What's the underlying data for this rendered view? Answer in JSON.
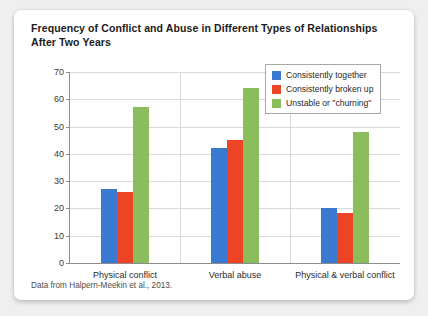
{
  "card": {
    "title": "Frequency of Conflict and Abuse in Different Types of Relationships After Two Years",
    "source_note": "Data from Halpern-Meekin et al., 2013."
  },
  "chart_data": {
    "type": "bar",
    "title": "Frequency of Conflict and Abuse in Different Types of Relationships After Two Years",
    "xlabel": "",
    "ylabel": "",
    "ylim": [
      0,
      70
    ],
    "yticks": [
      0,
      10,
      20,
      30,
      40,
      50,
      60,
      70
    ],
    "grid": true,
    "legend_position": "top-right",
    "categories": [
      "Physical conflict",
      "Verbal abuse",
      "Physical & verbal conflict"
    ],
    "series": [
      {
        "name": "Consistently together",
        "color": "#3a7ad0",
        "values": [
          27,
          42,
          20
        ]
      },
      {
        "name": "Consistently broken up",
        "color": "#ec4424",
        "values": [
          26,
          45,
          18.5
        ]
      },
      {
        "name": "Unstable or \"churning\"",
        "color": "#8cbd5c",
        "values": [
          57,
          64,
          48
        ]
      }
    ],
    "annotations": [
      "Data from Halpern-Meekin et al., 2013."
    ]
  }
}
